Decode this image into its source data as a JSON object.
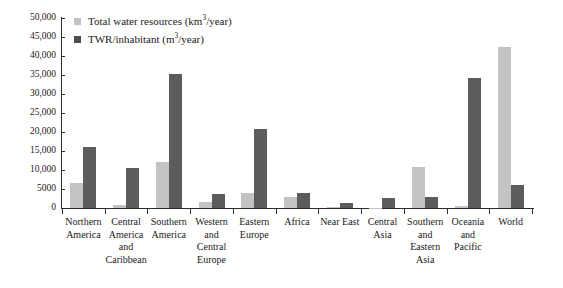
{
  "chart": {
    "type": "bar",
    "title": "",
    "legend_position": "top-left"
  },
  "legend": {
    "items": [
      {
        "label_prefix": "Total water resources (km",
        "exponent": "3",
        "label_suffix": "/year)",
        "color": "#c3c3c3",
        "swatch_name": "legend-swatch-total-water-resources"
      },
      {
        "label_prefix": "TWR/inhabitant (m",
        "exponent": "3",
        "label_suffix": "/year)",
        "color": "#5c5c5c",
        "swatch_name": "legend-swatch-twr-per-inhabitant"
      }
    ]
  },
  "yaxis": {
    "ticks": [
      "50,000",
      "45,000",
      "40,000",
      "35,000",
      "30,000",
      "25,000",
      "20,000",
      "15,000",
      "10,000",
      "5000",
      "0"
    ],
    "min": 0,
    "max": 50000,
    "step": 5000
  },
  "categories": [
    "Northern\nAmerica",
    "Central\nAmerica\nand\nCaribbean",
    "Southern\nAmerica",
    "Western\nand\nCentral\nEurope",
    "Eastern\nEurope",
    "Africa",
    "Near East",
    "Central\nAsia",
    "Southern\nand\nEastern\nAsia",
    "Oceania\nand\nPacific",
    "World"
  ],
  "chart_data": {
    "type": "bar",
    "title": "",
    "subtitle": "",
    "xlabel": "",
    "ylabel": "",
    "ylim": [
      0,
      50000
    ],
    "ytick_step": 5000,
    "grid": false,
    "legend_position": "top-left",
    "categories": [
      "Northern America",
      "Central America and Caribbean",
      "Southern America",
      "Western and Central Europe",
      "Eastern Europe",
      "Africa",
      "Near East",
      "Central Asia",
      "Southern and Eastern Asia",
      "Oceania and Pacific",
      "World"
    ],
    "series": [
      {
        "name": "Total water resources (km3/year)",
        "color": "#c3c3c3",
        "values": [
          6500,
          700,
          12000,
          1700,
          4000,
          3000,
          150,
          100,
          10700,
          400,
          42500
        ]
      },
      {
        "name": "TWR/inhabitant (m3/year)",
        "color": "#5c5c5c",
        "values": [
          16000,
          10600,
          35300,
          3700,
          20800,
          4000,
          1300,
          2600,
          2800,
          34200,
          6000
        ]
      }
    ]
  },
  "colors": {
    "series_light": "#c3c3c3",
    "series_dark": "#5c5c5c",
    "axis": "#2b2b2b",
    "background": "#ffffff"
  }
}
